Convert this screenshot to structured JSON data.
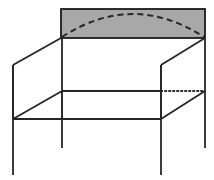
{
  "figure": {
    "title": "",
    "caption": "",
    "type": "line-drawing",
    "background_color": "#ffffff",
    "canvas": {
      "width": 214,
      "height": 180
    }
  },
  "style": {
    "stroke_color": "#262626",
    "panel_fill_color": "#a8a8a8",
    "panel_stroke_color": "#1a1a1a",
    "solid_stroke_width": 1.8,
    "panel_stroke_width": 1.8,
    "dashed_stroke_width": 2.0,
    "dotted_stroke_width": 1.8,
    "dash_pattern": "6,4",
    "dot_pattern": "1.4,2.6"
  },
  "shaded_panel": {
    "name": "top-shaded-panel",
    "x": 61,
    "y": 9,
    "width": 144,
    "height": 29,
    "fill": "#a8a8a8",
    "stroke": "#1a1a1a"
  },
  "dashed_arc": {
    "name": "dashed-arc",
    "description": "half-ellipse arc inside shaded panel",
    "start": [
      62,
      37
    ],
    "end": [
      204,
      37
    ],
    "apex": [
      133,
      14
    ],
    "path": "M 62 37 Q 133 -9 204 37"
  },
  "solid_lines": [
    {
      "name": "top-front-left-diagonal",
      "x1": 61,
      "y1": 38,
      "x2": 13,
      "y2": 65
    },
    {
      "name": "top-front-right-diagonal",
      "x1": 205,
      "y1": 38,
      "x2": 161,
      "y2": 65
    },
    {
      "name": "upper-left-vertical",
      "x1": 13,
      "y1": 65,
      "x2": 13,
      "y2": 119
    },
    {
      "name": "upper-right-vertical",
      "x1": 161,
      "y1": 65,
      "x2": 161,
      "y2": 119
    },
    {
      "name": "mid-shelf-front-edge",
      "x1": 62,
      "y1": 91,
      "x2": 161,
      "y2": 91
    },
    {
      "name": "lower-shelf-front-edge",
      "x1": 13,
      "y1": 119,
      "x2": 161,
      "y2": 119
    },
    {
      "name": "lower-shelf-left-diagonal",
      "x1": 13,
      "y1": 119,
      "x2": 62,
      "y2": 91
    },
    {
      "name": "lower-shelf-right-diagonal",
      "x1": 161,
      "y1": 119,
      "x2": 205,
      "y2": 91
    },
    {
      "name": "back-left-post",
      "x1": 62,
      "y1": 38,
      "x2": 62,
      "y2": 148
    },
    {
      "name": "back-right-post",
      "x1": 205,
      "y1": 38,
      "x2": 205,
      "y2": 148
    },
    {
      "name": "front-left-leg",
      "x1": 13,
      "y1": 65,
      "x2": 13,
      "y2": 175
    },
    {
      "name": "front-right-leg",
      "x1": 161,
      "y1": 65,
      "x2": 161,
      "y2": 175
    }
  ],
  "dotted_lines": [
    {
      "name": "hidden-vertical-left",
      "x1": 62,
      "y1": 92,
      "x2": 62,
      "y2": 118
    },
    {
      "name": "hidden-horizontal-right",
      "x1": 161,
      "y1": 91,
      "x2": 205,
      "y2": 91
    }
  ],
  "vertices": {
    "panel_top_left": [
      61,
      9
    ],
    "panel_top_right": [
      205,
      9
    ],
    "panel_bottom_left": [
      61,
      38
    ],
    "panel_bottom_right": [
      205,
      38
    ],
    "front_top_left": [
      13,
      65
    ],
    "front_top_right": [
      161,
      65
    ],
    "shelf_front_left": [
      13,
      119
    ],
    "shelf_front_right": [
      161,
      119
    ],
    "shelf_back_left": [
      62,
      91
    ],
    "shelf_back_right": [
      205,
      91
    ]
  }
}
